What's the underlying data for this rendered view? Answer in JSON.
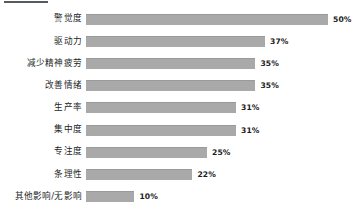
{
  "chart_data": {
    "type": "bar",
    "orientation": "horizontal",
    "title": "",
    "xlabel": "",
    "ylabel": "",
    "grid": false,
    "legend": "none",
    "xlim": [
      0,
      50
    ],
    "value_suffix": "%",
    "bar_color": "#a9a9a9",
    "categories": [
      "警觉度",
      "驱动力",
      "减少精神疲劳",
      "改善情绪",
      "生产率",
      "集中度",
      "专注度",
      "条理性",
      "其他影响/无影响"
    ],
    "values": [
      50,
      37,
      35,
      35,
      31,
      31,
      25,
      22,
      10
    ],
    "value_labels": [
      "50%",
      "37%",
      "35%",
      "35%",
      "31%",
      "31%",
      "25%",
      "22%",
      "10%"
    ]
  }
}
